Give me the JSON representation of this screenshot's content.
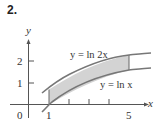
{
  "problem_number": "2.",
  "figure": {
    "axes": {
      "x_label": "x",
      "y_label": "y",
      "x_ticks": [
        "0",
        "1",
        "5"
      ],
      "y_ticks": [
        "1",
        "2"
      ]
    },
    "curves": [
      {
        "label": "y = ln 2x",
        "expression": "ln(2x)"
      },
      {
        "label": "y = ln x",
        "expression": "ln(x)"
      }
    ],
    "shaded_region": {
      "x_from": 1,
      "x_to": 5,
      "between": [
        "ln x",
        "ln 2x"
      ],
      "fill": "#d3d3d3"
    },
    "colors": {
      "curve": "#777777",
      "axis": "#555555",
      "shade": "#d3d3d3"
    }
  }
}
